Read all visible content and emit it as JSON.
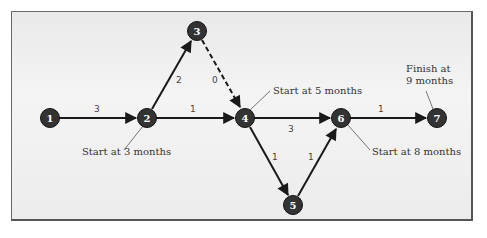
{
  "diagram": {
    "type": "network",
    "nodes": [
      {
        "id": "1",
        "label": "1",
        "x": 50,
        "y": 118
      },
      {
        "id": "2",
        "label": "2",
        "x": 147,
        "y": 118
      },
      {
        "id": "3",
        "label": "3",
        "x": 197,
        "y": 31
      },
      {
        "id": "4",
        "label": "4",
        "x": 245,
        "y": 118
      },
      {
        "id": "5",
        "label": "5",
        "x": 293,
        "y": 205
      },
      {
        "id": "6",
        "label": "6",
        "x": 341,
        "y": 118
      },
      {
        "id": "7",
        "label": "7",
        "x": 437,
        "y": 118
      }
    ],
    "edges": [
      {
        "from": "1",
        "to": "2",
        "weight": "3",
        "style": "solid"
      },
      {
        "from": "2",
        "to": "3",
        "weight": "2",
        "style": "solid"
      },
      {
        "from": "3",
        "to": "4",
        "weight": "0",
        "style": "dashed"
      },
      {
        "from": "2",
        "to": "4",
        "weight": "1",
        "style": "solid"
      },
      {
        "from": "4",
        "to": "6",
        "weight": "3",
        "style": "solid"
      },
      {
        "from": "4",
        "to": "5",
        "weight": "1",
        "style": "solid"
      },
      {
        "from": "5",
        "to": "6",
        "weight": "1",
        "style": "solid"
      },
      {
        "from": "6",
        "to": "7",
        "weight": "1",
        "style": "solid"
      }
    ],
    "annotations": {
      "node2": "Start at 3 months",
      "node4": "Start at 5 months",
      "node6": "Start at 8 months",
      "node7_line1": "Finish at",
      "node7_line2": "9 months"
    },
    "colors": {
      "node_fill": "#333333",
      "edge": "#1a1a1a",
      "background": "#eeeeee"
    }
  }
}
